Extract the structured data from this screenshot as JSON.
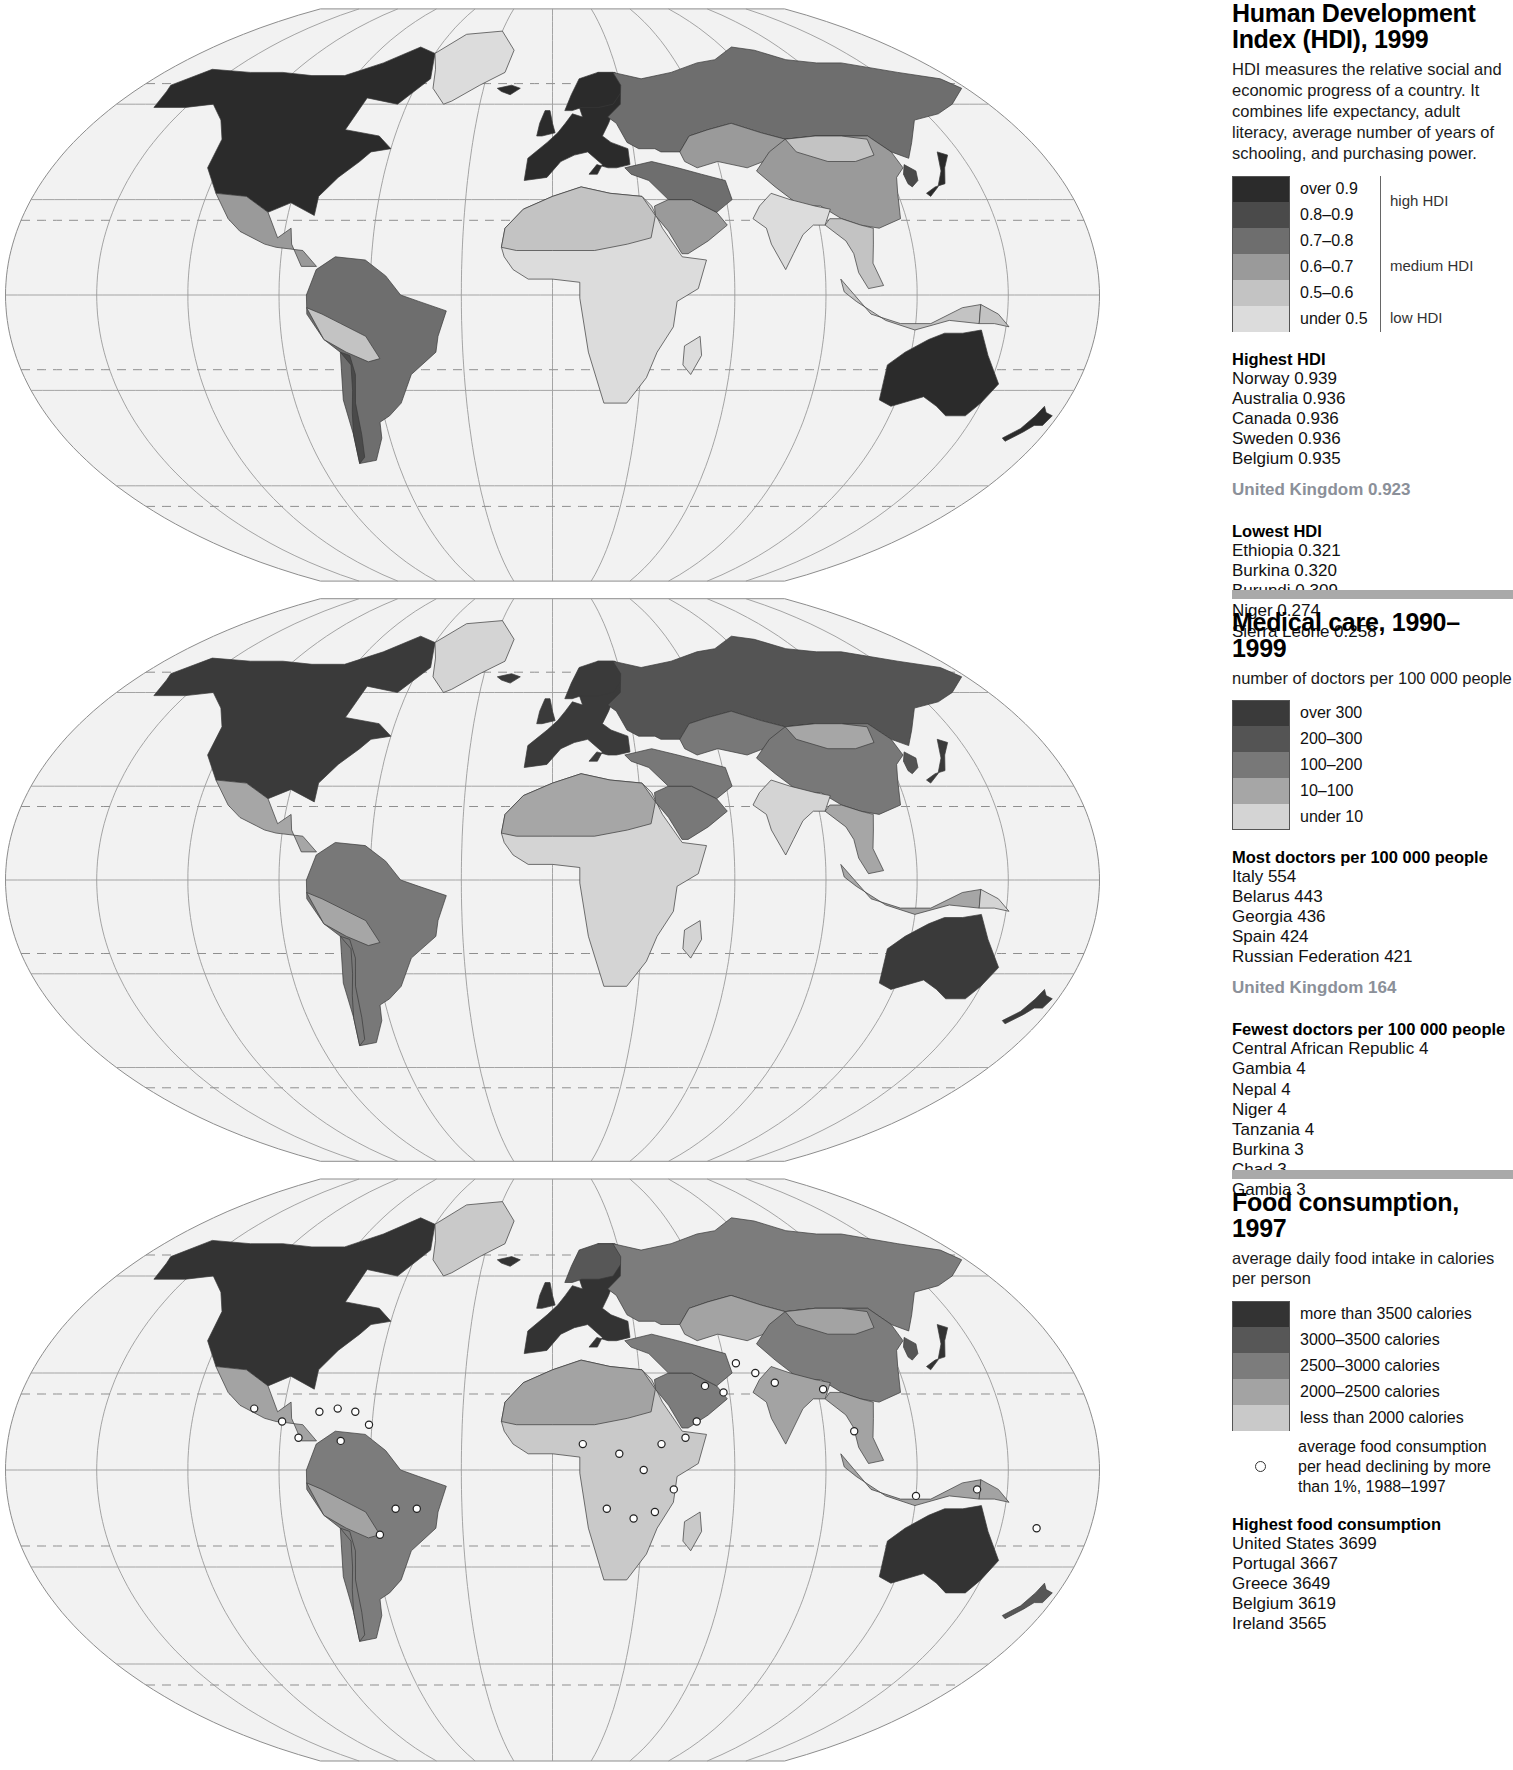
{
  "panels": [
    {
      "id": "hdi",
      "title": "Human Development Index (HDI), 1999",
      "blurb": "HDI measures the relative social and economic progress of a country. It combines life expectancy, adult literacy, average number of years of schooling, and purchasing power.",
      "subtitle": "",
      "has_rule": false,
      "legend": {
        "swatches": [
          {
            "color": "#2b2b2b",
            "label": "over 0.9"
          },
          {
            "color": "#4a4a4a",
            "label": "0.8–0.9"
          },
          {
            "color": "#6e6e6e",
            "label": "0.7–0.8"
          },
          {
            "color": "#9a9a9a",
            "label": "0.6–0.7"
          },
          {
            "color": "#c3c3c3",
            "label": "0.5–0.6"
          },
          {
            "color": "#dcdcdc",
            "label": "under 0.5"
          }
        ],
        "groups": [
          {
            "label": "high HDI",
            "from": 0,
            "to": 1
          },
          {
            "label": "medium HDI",
            "from": 2,
            "to": 4
          },
          {
            "label": "low HDI",
            "from": 5,
            "to": 5
          }
        ]
      },
      "lists": [
        {
          "heading": "Highest HDI",
          "rows": [
            "Norway 0.939",
            "Australia 0.936",
            "Canada 0.936",
            "Sweden 0.936",
            "Belgium 0.935"
          ]
        },
        {
          "highlight": "United Kingdom 0.923"
        },
        {
          "heading": "Lowest HDI",
          "rows": [
            "Ethiopia 0.321",
            "Burkina 0.320",
            "Burundi 0.309",
            "Niger 0.274",
            "Sierra Leone 0.258"
          ]
        }
      ]
    },
    {
      "id": "medical",
      "title": "Medical care, 1990–1999",
      "blurb": "",
      "subtitle": "number of doctors per 100 000 people",
      "has_rule": true,
      "legend": {
        "swatches": [
          {
            "color": "#3a3a3a",
            "label": "over 300"
          },
          {
            "color": "#545454",
            "label": "200–300"
          },
          {
            "color": "#787878",
            "label": "100–200"
          },
          {
            "color": "#a6a6a6",
            "label": "10–100"
          },
          {
            "color": "#d4d4d4",
            "label": "under 10"
          }
        ],
        "groups": []
      },
      "lists": [
        {
          "heading": "Most doctors per 100 000 people",
          "rows": [
            "Italy 554",
            "Belarus 443",
            "Georgia 436",
            "Spain 424",
            "Russian Federation 421"
          ]
        },
        {
          "highlight": "United Kingdom 164"
        },
        {
          "heading": "Fewest doctors per 100 000 people",
          "rows": [
            "Central African Republic 4",
            "Gambia 4",
            "Nepal 4",
            "Niger 4",
            "Tanzania 4",
            "Burkina 3",
            "Chad 3",
            "Gambia 3"
          ]
        }
      ]
    },
    {
      "id": "food",
      "title": "Food consumption, 1997",
      "blurb": "",
      "subtitle": "average daily food intake in calories per person",
      "has_rule": true,
      "legend": {
        "swatches": [
          {
            "color": "#333333",
            "label": "more than 3500 calories"
          },
          {
            "color": "#575757",
            "label": "3000–3500 calories"
          },
          {
            "color": "#7c7c7c",
            "label": "2500–3000 calories"
          },
          {
            "color": "#a3a3a3",
            "label": "2000–2500 calories"
          },
          {
            "color": "#c9c9c9",
            "label": "less than 2000 calories"
          }
        ],
        "groups": [],
        "dot_note": "average food consumption per head declining by more than 1%, 1988–1997",
        "dot_symbol": "declining-consumption-marker"
      },
      "lists": [
        {
          "heading": "Highest food consumption",
          "rows": [
            "United States 3699",
            "Portugal 3667",
            "Greece 3649",
            "Belgium 3619",
            "Ireland 3565"
          ]
        }
      ]
    }
  ],
  "chart_data": [
    {
      "type": "map",
      "title": "Human Development Index (HDI), 1999",
      "description": "HDI measures the relative social and economic progress of a country. It combines life expectancy, adult literacy, average number of years of schooling, and purchasing power.",
      "projection": "oval / pseudo-cylindrical world projection with graticule",
      "classes": [
        "over 0.9",
        "0.8-0.9",
        "0.7-0.8",
        "0.6-0.7",
        "0.5-0.6",
        "under 0.5"
      ],
      "class_colors": [
        "#2b2b2b",
        "#4a4a4a",
        "#6e6e6e",
        "#9a9a9a",
        "#c3c3c3",
        "#dcdcdc"
      ],
      "class_groups": {
        "high HDI": [
          "over 0.9",
          "0.8-0.9"
        ],
        "medium HDI": [
          "0.7-0.8",
          "0.6-0.7",
          "0.5-0.6"
        ],
        "low HDI": [
          "under 0.5"
        ]
      },
      "highest": [
        {
          "country": "Norway",
          "value": 0.939
        },
        {
          "country": "Australia",
          "value": 0.936
        },
        {
          "country": "Canada",
          "value": 0.936
        },
        {
          "country": "Sweden",
          "value": 0.936
        },
        {
          "country": "Belgium",
          "value": 0.935
        }
      ],
      "reference": {
        "country": "United Kingdom",
        "value": 0.923
      },
      "lowest": [
        {
          "country": "Ethiopia",
          "value": 0.321
        },
        {
          "country": "Burkina",
          "value": 0.32
        },
        {
          "country": "Burundi",
          "value": 0.309
        },
        {
          "country": "Niger",
          "value": 0.274
        },
        {
          "country": "Sierra Leone",
          "value": 0.258
        }
      ]
    },
    {
      "type": "map",
      "title": "Medical care, 1990-1999",
      "unit": "number of doctors per 100 000 people",
      "classes": [
        "over 300",
        "200-300",
        "100-200",
        "10-100",
        "under 10"
      ],
      "class_colors": [
        "#3a3a3a",
        "#545454",
        "#787878",
        "#a6a6a6",
        "#d4d4d4"
      ],
      "highest": [
        {
          "country": "Italy",
          "value": 554
        },
        {
          "country": "Belarus",
          "value": 443
        },
        {
          "country": "Georgia",
          "value": 436
        },
        {
          "country": "Spain",
          "value": 424
        },
        {
          "country": "Russian Federation",
          "value": 421
        }
      ],
      "reference": {
        "country": "United Kingdom",
        "value": 164
      },
      "lowest": [
        {
          "country": "Central African Republic",
          "value": 4
        },
        {
          "country": "Gambia",
          "value": 4
        },
        {
          "country": "Nepal",
          "value": 4
        },
        {
          "country": "Niger",
          "value": 4
        },
        {
          "country": "Tanzania",
          "value": 4
        },
        {
          "country": "Burkina",
          "value": 3
        },
        {
          "country": "Chad",
          "value": 3
        },
        {
          "country": "Gambia",
          "value": 3
        }
      ]
    },
    {
      "type": "map",
      "title": "Food consumption, 1997",
      "unit": "average daily food intake in calories per person",
      "classes": [
        "more than 3500 calories",
        "3000-3500 calories",
        "2500-3000 calories",
        "2000-2500 calories",
        "less than 2000 calories"
      ],
      "class_colors": [
        "#333333",
        "#575757",
        "#7c7c7c",
        "#a3a3a3",
        "#c9c9c9"
      ],
      "point_symbol": "average food consumption per head declining by more than 1%, 1988-1997",
      "highest": [
        {
          "country": "United States",
          "value": 3699
        },
        {
          "country": "Portugal",
          "value": 3667
        },
        {
          "country": "Greece",
          "value": 3649
        },
        {
          "country": "Belgium",
          "value": 3619
        },
        {
          "country": "Ireland",
          "value": 3565
        }
      ]
    }
  ]
}
